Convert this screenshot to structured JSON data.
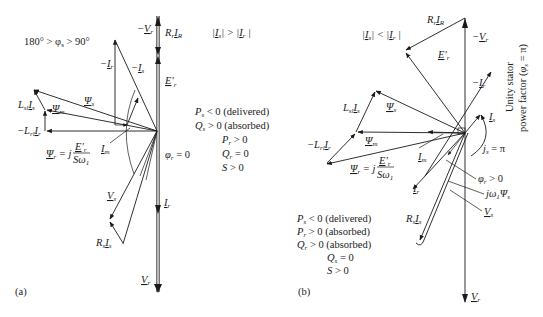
{
  "figure": {
    "panel_a": {
      "caption": "(a)",
      "labels": {
        "neg_vr": "−V",
        "neg_vr_sub": "r",
        "rr_ir": "R",
        "rr_ir_sub1": "r",
        "rr_ir_I": "I",
        "rr_ir_sub2": "R",
        "angle_cond": "180° > φ",
        "angle_cond_sub": "s",
        "angle_cond_tail": " > 90°",
        "neg_ir": "−I",
        "neg_ir_sub": "r",
        "neg_is": "−I",
        "neg_is_sub": "s",
        "er": "E′",
        "er_sub": "r",
        "lsl_is": "L",
        "lsl_is_sub": "sl",
        "lsl_is_I": "I",
        "lsl_is_I_sub": "s",
        "psi_s": "Ψ",
        "psi_s_sub": "s",
        "psi_m": "Ψ",
        "psi_m_sub": "m",
        "neg_lrl_ir": "−L",
        "neg_lrl_ir_sub": "rl",
        "neg_lrl_ir_I": "I",
        "neg_lrl_ir_I_sub": "r",
        "psi_r_eq": "Ψ",
        "psi_r_eq_sub": "r",
        "psi_r_eq_mid": " = j",
        "psi_r_frac_num": "E′",
        "psi_r_frac_num_sub": "r",
        "psi_r_frac_den": "Sω",
        "psi_r_frac_den_sub": "1",
        "im": "I",
        "im_sub": "m",
        "phi_r": "φ",
        "phi_r_sub": "r",
        "phi_r_tail": " = 0",
        "vs": "V",
        "vs_sub": "s",
        "rs_is": "R",
        "rs_is_sub": "s",
        "rs_is_I": "I",
        "rs_is_I_sub": "s",
        "ir": "I",
        "ir_sub": "r",
        "vr": "V",
        "vr_sub": "r"
      },
      "magnitude_relation": "|I_s| > |I_r|",
      "conditions": [
        "P_s < 0 (delivered)",
        "Q_s > 0 (absorbed)",
        "P_r > 0",
        "Q_r = 0",
        "S > 0"
      ]
    },
    "panel_b": {
      "caption": "(b)",
      "labels": {
        "rr_ir": "R_r I_R",
        "neg_vr": "−V_r",
        "er": "E′_r",
        "neg_ir": "−I_r",
        "is": "I_s",
        "lsl_is": "L_sl I_s",
        "psi_s": "Ψ_s",
        "psi_m": "Ψ_m",
        "neg_lrl_ir": "−L_rl I_r",
        "psi_r_eq": "Ψ_r = j E′_r / Sω_1",
        "im": "I_m",
        "js": "j_s = π",
        "phi_r": "φ_r > 0",
        "ir": "I_r",
        "jw_psi": "jω_1Ψ_s",
        "rs_is": "R_s I_s",
        "vs": "V_s",
        "vr": "V_r"
      },
      "magnitude_relation": "|I_s| < |I_r|",
      "side_note_line1": "Unity stator",
      "side_note_line2": "power factor (φ_s = π)",
      "conditions": [
        "P_s < 0 (delivered)",
        "P_r > 0 (absorbed)",
        "Q_r > 0 (absorbed)",
        "Q_s = 0",
        "S > 0"
      ]
    }
  }
}
